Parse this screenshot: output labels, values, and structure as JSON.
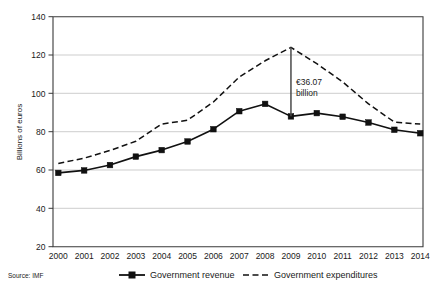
{
  "source": {
    "label": "Source: IMF"
  },
  "annotation": {
    "line1": "€36.07",
    "line2": "billion",
    "at_year": "2009",
    "from_value": 124.0,
    "to_value": 88.0
  },
  "legend": {
    "items": [
      {
        "label": "Government revenue",
        "style": "solid-square",
        "color": "#111111"
      },
      {
        "label": "Government expenditures",
        "style": "dashed",
        "color": "#111111"
      }
    ]
  },
  "chart_data": {
    "type": "line",
    "title": "",
    "subtitle": "",
    "xlabel": "",
    "ylabel": "Billions of euros",
    "ylim": [
      20,
      140
    ],
    "yticks": [
      20,
      40,
      60,
      80,
      100,
      120,
      140
    ],
    "ytick_labels": [
      "20",
      "40",
      "60",
      "80",
      "100",
      "120",
      "140"
    ],
    "grid": true,
    "grid_axis": "y",
    "legend_position": "below",
    "categories": [
      "2000",
      "2001",
      "2002",
      "2003",
      "2004",
      "2005",
      "2006",
      "2007",
      "2008",
      "2009",
      "2010",
      "2011",
      "2012",
      "2013",
      "2014"
    ],
    "series": [
      {
        "name": "Government revenue",
        "style": "solid",
        "marker": "square",
        "color": "#111111",
        "values": [
          58.5,
          59.8,
          62.6,
          67.0,
          70.4,
          74.9,
          81.3,
          90.7,
          94.5,
          88.0,
          89.7,
          87.8,
          84.8,
          81.0,
          79.2
        ]
      },
      {
        "name": "Government expenditures",
        "style": "dashed",
        "marker": "none",
        "color": "#111111",
        "values": [
          63.4,
          66.2,
          70.2,
          75.0,
          84.0,
          86.0,
          95.5,
          108.5,
          117.0,
          124.0,
          115.5,
          106.0,
          94.5,
          85.0,
          84.0
        ]
      }
    ],
    "annotations": [
      {
        "text": "€36.07 billion",
        "x": "2009",
        "y_top": 124.0,
        "y_bottom": 88.0
      }
    ]
  }
}
